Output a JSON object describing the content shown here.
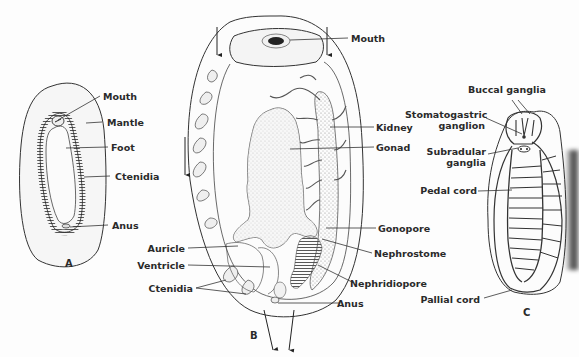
{
  "figure": {
    "panels": [
      {
        "id": "A",
        "letter": "A",
        "labels": [
          "Mouth",
          "Mantle",
          "Foot",
          "Ctenidia",
          "Anus"
        ]
      },
      {
        "id": "B",
        "letter": "B",
        "labels_right": [
          "Mouth",
          "Kidney",
          "Gonad",
          "Gonopore",
          "Nephrostome",
          "Nephridiopore",
          "Anus"
        ],
        "labels_left": [
          "Auricle",
          "Ventricle",
          "Ctenidia"
        ]
      },
      {
        "id": "C",
        "letter": "C",
        "labels": [
          "Buccal ganglia",
          "Stomatogastric ganglion",
          "Subradular ganglia",
          "Pedal cord",
          "Pallial cord"
        ]
      }
    ],
    "colors": {
      "ink": "#2a2a2a",
      "paper": "#fdfdfd",
      "stipple": "#8a8a8a"
    }
  },
  "A": {
    "letter": "A",
    "mouth": "Mouth",
    "mantle": "Mantle",
    "foot": "Foot",
    "ctenidia": "Ctenidia",
    "anus": "Anus"
  },
  "B": {
    "letter": "B",
    "mouth": "Mouth",
    "kidney": "Kidney",
    "gonad": "Gonad",
    "gonopore": "Gonopore",
    "nephrostome": "Nephrostome",
    "nephridiopore": "Nephridiopore",
    "anus": "Anus",
    "auricle": "Auricle",
    "ventricle": "Ventricle",
    "ctenidia": "Ctenidia"
  },
  "C": {
    "letter": "C",
    "buccal_ganglia": "Buccal ganglia",
    "stomatogastric_1": "Stomatogastric",
    "stomatogastric_2": "ganglion",
    "subradular_1": "Subradular",
    "subradular_2": "ganglia",
    "pedal_cord": "Pedal cord",
    "pallial_cord": "Pallial cord"
  }
}
